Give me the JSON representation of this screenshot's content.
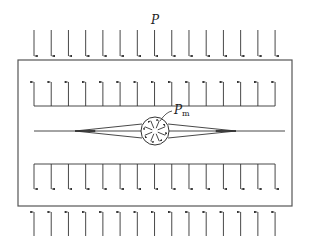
{
  "labels": {
    "external_pressure": "P",
    "inner_pressure_main": "P",
    "inner_pressure_sub": "m"
  },
  "diagram": {
    "stroke_color": "#333333",
    "arrow_color": "#333333",
    "background": "#ffffff",
    "arrow_count_per_row": 15,
    "arrow_x_start": 34,
    "arrow_spacing": 17.22,
    "block": {
      "x": 18,
      "y": 60,
      "width": 274,
      "height": 146
    },
    "top_outer_arrows": {
      "direction": "down",
      "y_from": 30,
      "y_to": 56
    },
    "upper_inner_arrows": {
      "direction": "up",
      "baseline_y": 106,
      "tip_y": 82
    },
    "lower_inner_arrows": {
      "direction": "down",
      "baseline_y": 164,
      "tip_y": 189
    },
    "bottom_outer_arrows": {
      "direction": "up",
      "y_from": 236,
      "tip_y": 212
    },
    "crack": {
      "y": 131,
      "x_start": 34,
      "x_end": 285,
      "lens_left": 75,
      "lens_right": 236,
      "half_open": 8
    },
    "inclusion": {
      "cx": 155,
      "cy": 131,
      "r": 14
    }
  }
}
